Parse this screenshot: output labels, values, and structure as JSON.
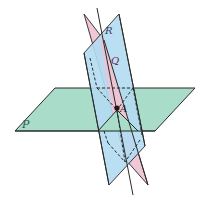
{
  "diagram": {
    "type": "three-planes-intersecting",
    "labels": {
      "plane_p": "P",
      "plane_q": "Q",
      "plane_r": "R",
      "point_a": "A"
    },
    "colors": {
      "plane_p": "#a9dcc9",
      "plane_q": "#b3dcf2",
      "plane_r": "#eec3d2",
      "stroke": "#2a2a2a",
      "label_p": "#2b5c4f",
      "label_q": "#6b2a4a",
      "label_r": "#3a3a5a"
    }
  }
}
